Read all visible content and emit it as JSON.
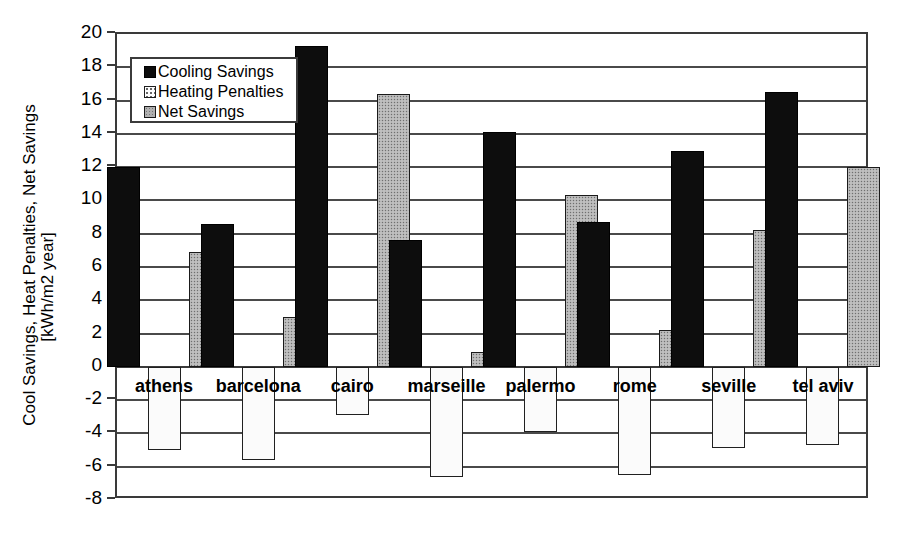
{
  "chart_data": {
    "type": "bar",
    "title": "",
    "subtitle": "",
    "xlabel": "",
    "ylabel": "Cool Savings, Heat Penalties, Net Savings [kWh/m2 year]",
    "ylabel_lines": [
      "Cool Savings, Heat Penalties, Net Savings",
      "[kWh/m2 year]"
    ],
    "categories": [
      "athens",
      "barcelona",
      "cairo",
      "marseille",
      "palermo",
      "rome",
      "seville",
      "tel aviv"
    ],
    "series": [
      {
        "name": "Cooling Savings",
        "color": "#0d0d0d",
        "values": [
          12.0,
          8.6,
          19.3,
          7.6,
          14.1,
          8.7,
          13.0,
          16.5
        ]
      },
      {
        "name": "Heating Penalties",
        "color": "#fbfbfb",
        "values": [
          -5.0,
          -5.6,
          -2.9,
          -6.6,
          -3.9,
          -6.5,
          -4.9,
          -4.7
        ]
      },
      {
        "name": "Net Savings",
        "color": "#b4b4b4",
        "values": [
          6.9,
          3.0,
          16.4,
          0.9,
          10.3,
          2.2,
          8.2,
          12.0
        ]
      }
    ],
    "ylim": [
      -8,
      20
    ],
    "ytick_values": [
      20,
      18,
      16,
      14,
      12,
      10,
      8,
      6,
      4,
      2,
      0,
      -2,
      -4,
      -6,
      -8
    ],
    "ytick_labels": [
      "20",
      "18",
      "16",
      "14",
      "12",
      "10",
      "8",
      "6",
      "4",
      "2",
      "0",
      "-2",
      "-4",
      "-6",
      "-8"
    ],
    "grid": true,
    "legend_position": "upper-left",
    "legend_entries": [
      "Cooling Savings",
      "Heating Penalties",
      "Net Savings"
    ]
  }
}
